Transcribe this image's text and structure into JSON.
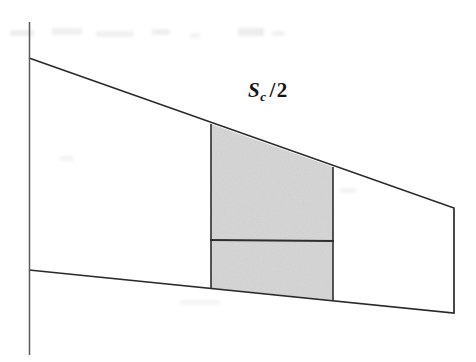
{
  "figure": {
    "background_color": "#ffffff",
    "line_color": "#2a2a2a",
    "shade_color": "#adadad",
    "label": {
      "text": "Sc / 2",
      "symbol": "S",
      "subscript": "c",
      "slash": "/",
      "divisor": "2",
      "x": 248,
      "y": 78
    }
  },
  "chart_data": {
    "type": "diagram-polygon",
    "title": "",
    "xlabel": "",
    "ylabel": "",
    "xlim": [
      0,
      476
    ],
    "ylim": [
      0,
      362
    ],
    "grid": false,
    "legend": null,
    "annotations": [
      {
        "text": "Sc / 2",
        "x": 280,
        "y": 97
      }
    ],
    "shapes": [
      {
        "name": "wing-planform-outline",
        "type": "polyline",
        "closed": false,
        "stroke": "#2a2a2a",
        "fill": "none",
        "points": [
          [
            29,
            58
          ],
          [
            454,
            208
          ],
          [
            454,
            313
          ],
          [
            29,
            270
          ]
        ]
      },
      {
        "name": "root-axis-line",
        "type": "line",
        "stroke": "#2a2a2a",
        "points": [
          [
            29,
            22
          ],
          [
            29,
            355
          ]
        ]
      },
      {
        "name": "control-surface-strip",
        "type": "polygon",
        "closed": true,
        "stroke": "#2a2a2a",
        "fill": "#adadad",
        "points": [
          [
            211,
            124
          ],
          [
            333,
            167
          ],
          [
            333,
            300
          ],
          [
            211,
            288
          ]
        ]
      },
      {
        "name": "inner-chord-divider",
        "type": "line",
        "stroke": "#2a2a2a",
        "points": [
          [
            211,
            240
          ],
          [
            333,
            241
          ]
        ]
      }
    ],
    "measurements": {
      "root_chord_top_y": 58,
      "root_chord_bottom_y": 270,
      "tip_chord_top_y": 208,
      "tip_chord_bottom_y": 313,
      "span_left_x": 29,
      "span_right_x": 454,
      "strip_left_x": 211,
      "strip_right_x": 333,
      "divider_y": 240
    }
  },
  "scan_artifacts": [
    {
      "x": 10,
      "y": 30,
      "w": 24,
      "h": 6
    },
    {
      "x": 52,
      "y": 28,
      "w": 30,
      "h": 7
    },
    {
      "x": 96,
      "y": 31,
      "w": 38,
      "h": 6
    },
    {
      "x": 152,
      "y": 29,
      "w": 18,
      "h": 6
    },
    {
      "x": 190,
      "y": 33,
      "w": 10,
      "h": 5
    },
    {
      "x": 238,
      "y": 28,
      "w": 26,
      "h": 8
    },
    {
      "x": 272,
      "y": 31,
      "w": 12,
      "h": 5
    },
    {
      "x": 340,
      "y": 188,
      "w": 16,
      "h": 5
    },
    {
      "x": 60,
      "y": 156,
      "w": 14,
      "h": 5
    }
  ]
}
